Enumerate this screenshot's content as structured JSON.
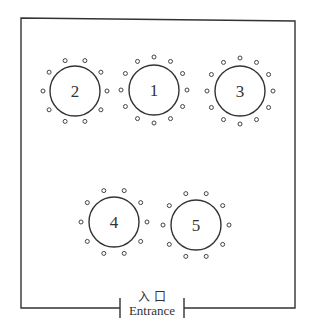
{
  "diagram": {
    "room": {
      "left": 21,
      "top": 18,
      "right": 295,
      "bottom": 308,
      "entrance_left": 120,
      "entrance_right": 184
    },
    "entrance": {
      "label_cn": "入 口",
      "label_en": "Entrance"
    },
    "tables": [
      {
        "id": "2",
        "label": "2",
        "cx": 75,
        "cy": 91,
        "r": 25,
        "seats": 10,
        "seat_r": 32
      },
      {
        "id": "1",
        "label": "1",
        "cx": 154,
        "cy": 90,
        "r": 25,
        "seats": 12,
        "seat_r": 33
      },
      {
        "id": "3",
        "label": "3",
        "cx": 240,
        "cy": 91,
        "r": 25,
        "seats": 12,
        "seat_r": 33
      },
      {
        "id": "4",
        "label": "4",
        "cx": 114,
        "cy": 222,
        "r": 25,
        "seats": 10,
        "seat_r": 33
      },
      {
        "id": "5",
        "label": "5",
        "cx": 196,
        "cy": 225,
        "r": 25,
        "seats": 10,
        "seat_r": 33
      }
    ]
  }
}
